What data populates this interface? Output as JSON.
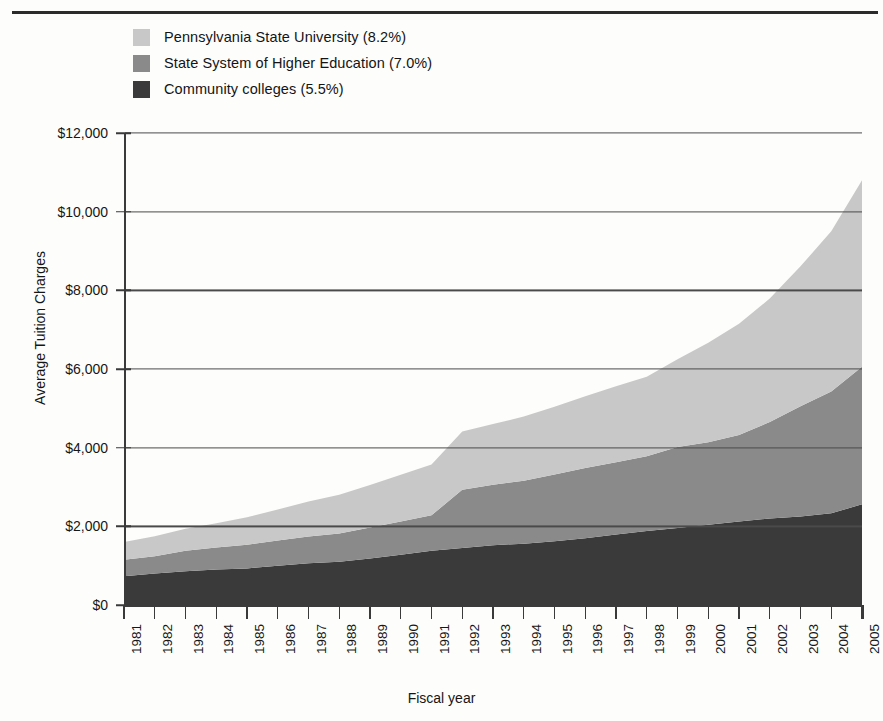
{
  "chart_data": {
    "type": "area",
    "stacked": true,
    "title": "",
    "xlabel": "Fiscal year",
    "ylabel": "Average Tuition Charges",
    "ylim": [
      0,
      12000
    ],
    "yticks": [
      0,
      2000,
      4000,
      6000,
      8000,
      10000,
      12000
    ],
    "ytick_labels": [
      "$0",
      "$2,000",
      "$4,000",
      "$6,000",
      "$8,000",
      "$10,000",
      "$12,000"
    ],
    "grid": true,
    "legend_position": "top-left",
    "categories": [
      "1981",
      "1982",
      "1983",
      "1984",
      "1985",
      "1986",
      "1987",
      "1988",
      "1989",
      "1990",
      "1991",
      "1992",
      "1993",
      "1994",
      "1995",
      "1996",
      "1997",
      "1998",
      "1999",
      "2000",
      "2001",
      "2002",
      "2003",
      "2004",
      "2005"
    ],
    "x": [
      1981,
      1982,
      1983,
      1984,
      1985,
      1986,
      1987,
      1988,
      1989,
      1990,
      1991,
      1992,
      1993,
      1994,
      1995,
      1996,
      1997,
      1998,
      1999,
      2000,
      2001,
      2002,
      2003,
      2004,
      2005
    ],
    "series": [
      {
        "name": "Community colleges (5.5%)",
        "legend_label": "Community colleges (5.5%)",
        "growth_rate": "5.5%",
        "color": "#3a3a3a",
        "order": 1,
        "values": [
          730,
          800,
          860,
          900,
          930,
          1000,
          1060,
          1100,
          1180,
          1280,
          1380,
          1450,
          1520,
          1560,
          1620,
          1700,
          1790,
          1880,
          1960,
          2040,
          2120,
          2200,
          2250,
          2330,
          2560
        ]
      },
      {
        "name": "State System of Higher Education (7.0%)",
        "legend_label": "State System of Higher Education (7.0%)",
        "growth_rate": "7.0%",
        "color": "#8a8a8a",
        "order": 2,
        "values": [
          420,
          440,
          520,
          560,
          600,
          640,
          680,
          720,
          790,
          840,
          900,
          1480,
          1540,
          1600,
          1700,
          1780,
          1840,
          1900,
          2060,
          2100,
          2200,
          2450,
          2800,
          3100,
          3500
        ]
      },
      {
        "name": "Pennsylvania State University (8.2%)",
        "legend_label": "Pennsylvania State University (8.2%)",
        "growth_rate": "8.2%",
        "color": "#c8c8c8",
        "order": 3,
        "values": [
          450,
          510,
          560,
          620,
          700,
          790,
          890,
          980,
          1080,
          1190,
          1290,
          1480,
          1540,
          1630,
          1720,
          1830,
          1930,
          2020,
          2230,
          2530,
          2830,
          3140,
          3560,
          4070,
          4740
        ]
      }
    ],
    "cumulative_totals": [
      1600,
      1750,
      1940,
      2080,
      2230,
      2430,
      2630,
      2800,
      3050,
      3310,
      3570,
      4410,
      4600,
      4790,
      5040,
      5310,
      5560,
      5800,
      6250,
      6670,
      7150,
      7790,
      8610,
      9500,
      10800
    ],
    "cumulative_lower_boundary": [
      730,
      800,
      860,
      900,
      930,
      1000,
      1060,
      1100,
      1180,
      1280,
      1380,
      1450,
      1520,
      1560,
      1620,
      1700,
      1790,
      1880,
      1960,
      2040,
      2120,
      2200,
      2250,
      2330,
      2560
    ],
    "cumulative_mid_boundary": [
      1150,
      1240,
      1380,
      1460,
      1530,
      1640,
      1740,
      1820,
      1970,
      2120,
      2280,
      2930,
      3060,
      3160,
      3320,
      3480,
      3630,
      3780,
      4020,
      4140,
      4320,
      4650,
      5050,
      5430,
      6060
    ]
  },
  "legend": {
    "items": [
      {
        "label": "Pennsylvania State University (8.2%)",
        "color": "#c8c8c8"
      },
      {
        "label": "State System of Higher Education (7.0%)",
        "color": "#8a8a8a"
      },
      {
        "label": "Community colleges (5.5%)",
        "color": "#3a3a3a"
      }
    ]
  },
  "axes": {
    "y_title": "Average Tuition Charges",
    "x_title": "Fiscal year"
  }
}
